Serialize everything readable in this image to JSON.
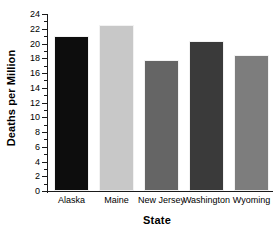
{
  "chart_data": {
    "type": "bar",
    "title": "",
    "subtitle": "",
    "xlabel": "State",
    "ylabel": "Deaths per Million",
    "categories": [
      "Alaska",
      "Maine",
      "New Jersey",
      "Washington",
      "Wyoming"
    ],
    "values": [
      21.0,
      22.5,
      17.8,
      20.3,
      18.5
    ],
    "series": [
      {
        "name": "Deaths per Million",
        "values": [
          21.0,
          22.5,
          17.8,
          20.3,
          18.5
        ]
      }
    ],
    "bar_colors": [
      "#0d0d0d",
      "#c8c8c8",
      "#656565",
      "#3a3a3a",
      "#7d7d7d"
    ],
    "ylim": [
      0,
      24
    ],
    "xlim_categories": 5,
    "y_major_step": 2,
    "y_minor_step": 1,
    "y_tick_labels": [
      "24",
      "22",
      "20",
      "18",
      "16",
      "14",
      "12",
      "10",
      "8",
      "6",
      "4",
      "2",
      "0"
    ],
    "y_tick_values": [
      24,
      22,
      20,
      18,
      16,
      14,
      12,
      10,
      8,
      6,
      4,
      2,
      0
    ],
    "grid": false,
    "legend": false,
    "legend_position": "none",
    "annotations": [],
    "axis_color": "#1a1a1a",
    "background_color": "#ffffff",
    "text_color": "#000000"
  }
}
